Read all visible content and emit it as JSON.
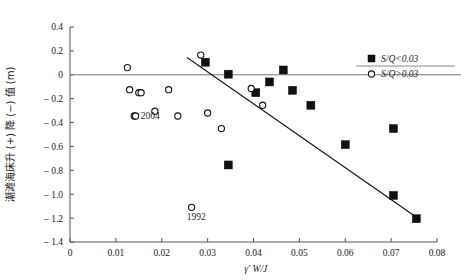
{
  "chart_data": {
    "type": "scatter",
    "title": "",
    "xlabel": "γ' W/J",
    "ylabel": "潮滩海床升 (+) 降 (−) 值 (m)",
    "xlim": [
      0,
      0.08
    ],
    "ylim": [
      -1.4,
      0.4
    ],
    "xticks": [
      "0",
      "0.01",
      "0.02",
      "0.03",
      "0.04",
      "0.05",
      "0.06",
      "0.07",
      "0.08"
    ],
    "xtick_values": [
      0,
      0.01,
      0.02,
      0.03,
      0.04,
      0.05,
      0.06,
      0.07,
      0.08
    ],
    "yticks": [
      "0.4",
      "0.2",
      "0",
      "-0.2",
      "-0.4",
      "-0.6",
      "-0.8",
      "-1.0",
      "-1.2",
      "-1.4"
    ],
    "ytick_values": [
      0.4,
      0.2,
      0,
      -0.2,
      -0.4,
      -0.6,
      -0.8,
      -1.0,
      -1.2,
      -1.4
    ],
    "grid": false,
    "legend_position": "top-right",
    "zero_line": 0,
    "series": [
      {
        "name": "S/Q<0.03",
        "marker": "filled-square",
        "color": "#111111",
        "points": [
          [
            0.0295,
            0.105
          ],
          [
            0.0345,
            0.005
          ],
          [
            0.0405,
            -0.15
          ],
          [
            0.0435,
            -0.06
          ],
          [
            0.0465,
            0.04
          ],
          [
            0.0485,
            -0.13
          ],
          [
            0.0525,
            -0.255
          ],
          [
            0.0345,
            -0.755
          ],
          [
            0.06,
            -0.585
          ],
          [
            0.0705,
            -0.45
          ],
          [
            0.0705,
            -1.01
          ],
          [
            0.0755,
            -1.205
          ]
        ]
      },
      {
        "name": "S/Q>0.03",
        "marker": "open-circle",
        "color": "#111111",
        "points": [
          [
            0.0125,
            0.06
          ],
          [
            0.013,
            -0.125
          ],
          [
            0.015,
            -0.15
          ],
          [
            0.0155,
            -0.15
          ],
          [
            0.014,
            -0.345
          ],
          [
            0.0143,
            -0.345
          ],
          [
            0.0185,
            -0.305
          ],
          [
            0.0215,
            -0.125
          ],
          [
            0.0235,
            -0.345
          ],
          [
            0.0285,
            0.165
          ],
          [
            0.03,
            -0.32
          ],
          [
            0.033,
            -0.45
          ],
          [
            0.0395,
            -0.115
          ],
          [
            0.042,
            -0.255
          ],
          [
            0.0265,
            -1.11
          ]
        ]
      }
    ],
    "trend_line": {
      "x1": 0.0255,
      "y1": 0.145,
      "x2": 0.076,
      "y2": -1.205
    },
    "annotations": [
      {
        "text": "2004",
        "x": 0.0175,
        "y": -0.37
      },
      {
        "text": "1992",
        "x": 0.0275,
        "y": -1.215
      }
    ]
  },
  "legend": {
    "entries": [
      {
        "label": "S/Q<0.03",
        "marker": "filled-square"
      },
      {
        "label": "S/Q>0.03",
        "marker": "open-circle"
      }
    ]
  },
  "colors": {
    "axis": "#555555",
    "zero_line": "#777777",
    "trend": "#111111",
    "marker": "#111111",
    "background": "#ffffff"
  }
}
